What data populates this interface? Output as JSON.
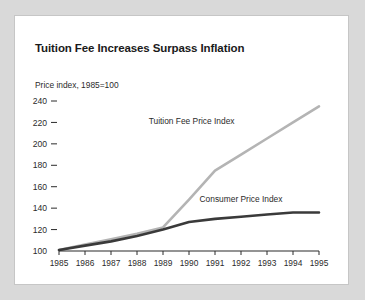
{
  "card": {
    "background": "#ffffff",
    "border_color": "#c6c6c6",
    "page_background": "#d9d9d9"
  },
  "chart_data": {
    "type": "line",
    "title": "Tuition Fee Increases Surpass Inflation",
    "subtitle": "Price index, 1985=100",
    "xlabel": "",
    "ylabel": "Price index, 1985=100",
    "categories": [
      "1985",
      "1986",
      "1987",
      "1988",
      "1989",
      "1990",
      "1991",
      "1992",
      "1993",
      "1994",
      "1995"
    ],
    "x": [
      1985,
      1986,
      1987,
      1988,
      1989,
      1990,
      1991,
      1992,
      1993,
      1994,
      1995
    ],
    "xlim": [
      1985,
      1995
    ],
    "ylim": [
      100,
      240
    ],
    "ytick_labels": [
      "240",
      "220",
      "200",
      "180",
      "160",
      "140",
      "120",
      "100"
    ],
    "yticks": [
      240,
      220,
      200,
      180,
      160,
      140,
      120,
      100
    ],
    "ytick_step": 20,
    "grid": false,
    "legend": "inline-labels",
    "series": [
      {
        "name": "Tuition Fee Price Index",
        "color": "#b4b4b4",
        "label_x": 1990.1,
        "label_y": 219,
        "values": [
          101,
          106,
          111,
          116,
          122,
          148,
          175,
          190,
          205,
          220,
          235
        ]
      },
      {
        "name": "Consumer Price Index",
        "color": "#3a3a3a",
        "label_x": 1992.0,
        "label_y": 146,
        "values": [
          101,
          105,
          109,
          114,
          120,
          127,
          130,
          132,
          134,
          136,
          136
        ]
      }
    ]
  }
}
